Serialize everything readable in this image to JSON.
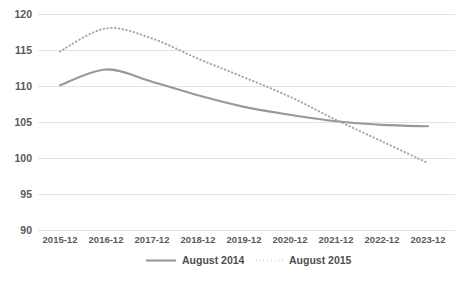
{
  "chart_data": {
    "type": "line",
    "title": "",
    "subtitle": "",
    "xlabel": "",
    "ylabel": "",
    "grid": true,
    "legend_position": "bottom",
    "categories": [
      "2015-12",
      "2016-12",
      "2017-12",
      "2018-12",
      "2019-12",
      "2020-12",
      "2021-12",
      "2022-12",
      "2023-12"
    ],
    "ylim": [
      90,
      120
    ],
    "yticks": [
      90,
      95,
      100,
      105,
      110,
      115,
      120
    ],
    "ytick_labels": [
      "90",
      "95",
      "100",
      "105",
      "110",
      "115",
      "120"
    ],
    "series": [
      {
        "name": "August 2014",
        "style": "solid",
        "color": "#989898",
        "values": [
          110.1,
          112.3,
          110.6,
          108.7,
          107.1,
          106.0,
          105.1,
          104.6,
          104.4
        ]
      },
      {
        "name": "August 2015",
        "style": "dotted",
        "color": "#a8a8a8",
        "values": [
          114.8,
          118.0,
          116.6,
          113.8,
          111.2,
          108.5,
          105.3,
          102.3,
          99.3
        ]
      }
    ]
  },
  "legend": {
    "items": [
      {
        "label": "August 2014",
        "style": "solid"
      },
      {
        "label": "August 2015",
        "style": "dotted"
      }
    ]
  },
  "axis": {
    "y_labels": [
      "120",
      "115",
      "110",
      "105",
      "100",
      "95",
      "90"
    ],
    "x_labels": [
      "2015-12",
      "2016-12",
      "2017-12",
      "2018-12",
      "2019-12",
      "2020-12",
      "2021-12",
      "2022-12",
      "2023-12"
    ]
  },
  "colors": {
    "gridline": "#e3e3e3",
    "series_solid": "#989898",
    "series_dotted": "#a8a8a8",
    "text": "#595959",
    "background": "#ffffff"
  }
}
